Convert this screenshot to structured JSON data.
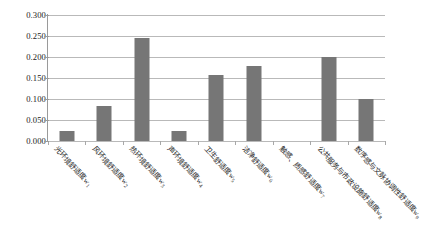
{
  "chart_data": {
    "type": "bar",
    "title": "",
    "subtitle": "",
    "xlabel": "",
    "ylabel": "",
    "ylim": [
      0.0,
      0.3
    ],
    "ytick_labels": [
      "0.300",
      "0.250",
      "0.200",
      "0.150",
      "0.100",
      "0.050",
      "0.000"
    ],
    "ytick_values": [
      0.3,
      0.25,
      0.2,
      0.15,
      0.1,
      0.05,
      0.0
    ],
    "grid": "horizontal",
    "legend": "none",
    "bar_color": "#767676",
    "gridline_color": "#b9b9b9",
    "axis_color": "#9a9a9a",
    "categories": [
      "光环境舒适度w",
      "风环境舒适度w",
      "热环境舒适度w",
      "声环境舒适度w",
      "卫生舒适度w",
      "洁净舒适度w",
      "触感、质感舒适度w",
      "公共服务与市政设施舒适度w",
      "数序感与文脉协调性舒适度w"
    ],
    "category_subscripts": [
      "1",
      "2",
      "3",
      "4",
      "5",
      "6",
      "7",
      "8",
      "9"
    ],
    "values": [
      0.024,
      0.083,
      0.246,
      0.025,
      0.158,
      0.178,
      0.0,
      0.2,
      0.1
    ]
  }
}
